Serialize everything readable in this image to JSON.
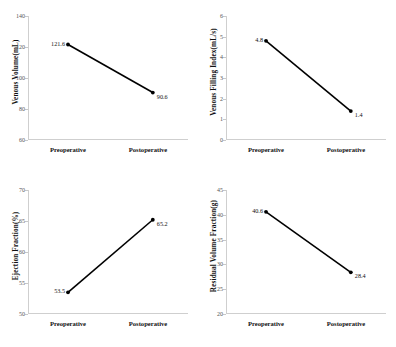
{
  "figure": {
    "background": "#ffffff",
    "line_color": "#000000",
    "marker_color": "#000000",
    "axis_color": "#cfcfcf",
    "categories": [
      "Preoperative",
      "Postoperative"
    ]
  },
  "chart_data": [
    {
      "type": "line",
      "title": "",
      "xlabel": "",
      "ylabel": "Venous Volume(mL)",
      "categories": [
        "Preoperative",
        "Postoperative"
      ],
      "values": [
        121.6,
        90.6
      ],
      "data_labels": [
        "121.6",
        "90.6"
      ],
      "ylim": [
        60,
        140
      ],
      "yticks": [
        60,
        80,
        100,
        120,
        140
      ],
      "ytick_labels": [
        "60",
        "80",
        "100",
        "120",
        "140"
      ],
      "grid": false,
      "legend": "none"
    },
    {
      "type": "line",
      "title": "",
      "xlabel": "",
      "ylabel": "Venous Filling Index(mL/s)",
      "categories": [
        "Preoperative",
        "Postoperative"
      ],
      "values": [
        4.8,
        1.4
      ],
      "data_labels": [
        "4.8",
        "1.4"
      ],
      "ylim": [
        0,
        6
      ],
      "yticks": [
        0,
        1,
        2,
        3,
        4,
        5,
        6
      ],
      "ytick_labels": [
        "0",
        "1",
        "2",
        "3",
        "4",
        "5",
        "6"
      ],
      "grid": false,
      "legend": "none"
    },
    {
      "type": "line",
      "title": "",
      "xlabel": "",
      "ylabel": "Ejection Fraction(%)",
      "categories": [
        "Preoperative",
        "Postoperative"
      ],
      "values": [
        53.5,
        65.2
      ],
      "data_labels": [
        "53.5",
        "65.2"
      ],
      "ylim": [
        50,
        70
      ],
      "yticks": [
        50,
        55,
        60,
        65,
        70
      ],
      "ytick_labels": [
        "50",
        "55",
        "60",
        "65",
        "70"
      ],
      "grid": false,
      "legend": "none"
    },
    {
      "type": "line",
      "title": "",
      "xlabel": "",
      "ylabel": "Residual Volume Fraction(g)",
      "categories": [
        "Preoperative",
        "Postoperative"
      ],
      "values": [
        40.6,
        28.4
      ],
      "data_labels": [
        "40.6",
        "28.4"
      ],
      "ylim": [
        20,
        45
      ],
      "yticks": [
        20,
        25,
        30,
        35,
        40,
        45
      ],
      "ytick_labels": [
        "20",
        "25",
        "30",
        "35",
        "40",
        "45"
      ],
      "grid": false,
      "legend": "none"
    }
  ]
}
